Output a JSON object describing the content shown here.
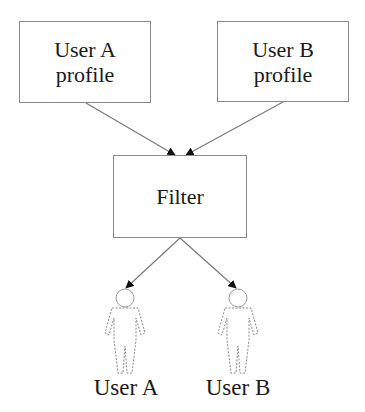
{
  "diagram": {
    "nodes": {
      "user_a_profile": {
        "line1": "User A",
        "line2": "profile"
      },
      "user_b_profile": {
        "line1": "User B",
        "line2": "profile"
      },
      "filter": {
        "label": "Filter"
      }
    },
    "users": {
      "user_a": {
        "label": "User A",
        "icon": "person-outline-icon"
      },
      "user_b": {
        "label": "User B",
        "icon": "person-outline-icon"
      }
    },
    "edges": [
      {
        "from": "User A profile",
        "to": "Filter"
      },
      {
        "from": "User B profile",
        "to": "Filter"
      },
      {
        "from": "Filter",
        "to": "User A"
      },
      {
        "from": "Filter",
        "to": "User B"
      }
    ],
    "colors": {
      "line": "#7a7a7a",
      "text": "#1a1a1a",
      "arrowhead": "#111111",
      "background": "#ffffff"
    }
  }
}
